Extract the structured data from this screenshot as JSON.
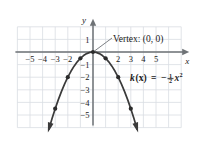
{
  "figure": {
    "title": "",
    "axis_labels": {
      "x": "x",
      "y": "y"
    },
    "annotations": {
      "vertex_label": "Vertex: (0, 0)",
      "equation_fn": "k",
      "equation_var": "(x)",
      "equation_eq": "=",
      "equation_sign": "−",
      "equation_frac_num": "1",
      "equation_frac_den": "2",
      "equation_x": "x",
      "equation_exp": "2",
      "equation_plain": "k(x) = -1/2 x²"
    },
    "colors": {
      "grid": "#d9dde2",
      "axis": "#6e7276",
      "curve": "#3a3a3a",
      "point": "#2b2b2b",
      "text": "#1a1a1a",
      "background": "#ffffff"
    }
  },
  "chart_data": {
    "type": "line",
    "title": "",
    "xlabel": "x",
    "ylabel": "y",
    "function": "k(x) = -1/2 x^2",
    "grid": true,
    "legend": "none",
    "xlim": [
      -6,
      7
    ],
    "ylim": [
      -6,
      2
    ],
    "xticks": [
      -5,
      -4,
      -3,
      -2,
      2,
      3,
      4,
      5
    ],
    "xtick_labels": [
      "−5",
      "−4",
      "−3",
      "−2",
      "2",
      "3",
      "4",
      "5"
    ],
    "yticks": [
      1,
      -1,
      -2,
      -3,
      -4,
      -5
    ],
    "ytick_labels": [
      "1",
      "−1",
      "−2",
      "−3",
      "−4",
      "−5"
    ],
    "vertex": [
      0,
      0
    ],
    "marked_points": [
      {
        "x": -3,
        "y": -4.5
      },
      {
        "x": -2,
        "y": -2
      },
      {
        "x": -1,
        "y": -0.5
      },
      {
        "x": 0,
        "y": 0
      },
      {
        "x": 1,
        "y": -0.5
      },
      {
        "x": 2,
        "y": -2
      },
      {
        "x": 3,
        "y": -4.5
      }
    ],
    "curve_x": [
      -3.5,
      -3.25,
      -3,
      -2.75,
      -2.5,
      -2.25,
      -2,
      -1.75,
      -1.5,
      -1.25,
      -1,
      -0.75,
      -0.5,
      -0.25,
      0,
      0.25,
      0.5,
      0.75,
      1,
      1.25,
      1.5,
      1.75,
      2,
      2.25,
      2.5,
      2.75,
      3,
      3.25,
      3.5
    ],
    "curve_y": [
      -6.125,
      -5.281,
      -4.5,
      -3.781,
      -3.125,
      -2.531,
      -2,
      -1.531,
      -1.125,
      -0.781,
      -0.5,
      -0.281,
      -0.125,
      -0.031,
      0,
      -0.031,
      -0.125,
      -0.281,
      -0.5,
      -0.781,
      -1.125,
      -1.531,
      -2,
      -2.531,
      -3.125,
      -3.781,
      -4.5,
      -5.281,
      -6.125
    ]
  }
}
